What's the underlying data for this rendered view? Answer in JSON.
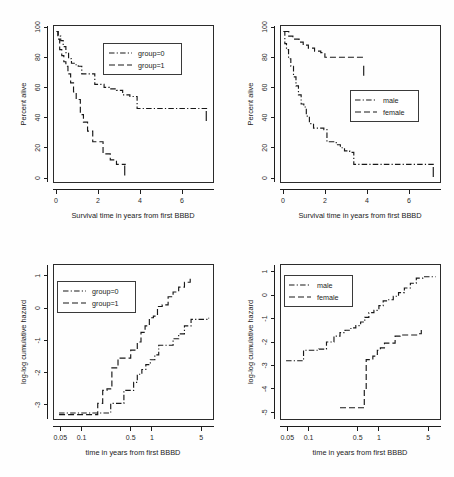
{
  "figure": {
    "background_color": "#fefefe",
    "line_color": "#181818",
    "panel_count": 4,
    "layout": "2x2 grid"
  },
  "chart_data": [
    {
      "id": "top-left",
      "type": "line",
      "title": "",
      "xlabel": "Survival time in years from first BBBD",
      "ylabel": "Percent alive",
      "xlim": [
        -0.15,
        7.6
      ],
      "ylim": [
        0,
        104
      ],
      "xticks": [
        0,
        2,
        4,
        6
      ],
      "xticklabels": [
        "0",
        "2",
        "4",
        "6"
      ],
      "yticks": [
        0,
        20,
        40,
        60,
        80,
        100
      ],
      "yticklabels": [
        "0",
        "20",
        "40",
        "60",
        "80",
        "100"
      ],
      "grid": false,
      "legend_position": "top-right-inside",
      "legend": [
        "group=0",
        "group=1"
      ],
      "series": [
        {
          "name": "group=0",
          "linestyle": "dashdot",
          "x": [
            0,
            0.08,
            0.2,
            0.32,
            0.45,
            0.58,
            0.72,
            0.9,
            1.05,
            1.22,
            1.55,
            1.85,
            2.05,
            2.3,
            2.55,
            2.9,
            3.2,
            3.55,
            3.9,
            4.15,
            7.3
          ],
          "y": [
            100,
            97,
            94,
            90,
            86,
            82,
            79,
            78,
            77,
            72,
            72,
            65,
            65,
            63,
            62,
            61,
            58,
            57,
            49,
            49,
            49
          ],
          "censor_marks_x": [
            7.25
          ],
          "censor_marks_y": [
            44
          ]
        },
        {
          "name": "group=1",
          "linestyle": "dashed",
          "x": [
            0,
            0.06,
            0.15,
            0.25,
            0.35,
            0.45,
            0.55,
            0.68,
            0.82,
            0.95,
            1.05,
            1.15,
            1.3,
            1.5,
            1.75,
            2.05,
            2.25,
            2.45,
            2.6,
            2.9,
            3.35
          ],
          "y": [
            100,
            95,
            88,
            84,
            80,
            77,
            72,
            66,
            60,
            55,
            55,
            45,
            40,
            34,
            27,
            27,
            19,
            19,
            15,
            12,
            12
          ],
          "censor_marks_x": [
            3.3
          ],
          "censor_marks_y": [
            8
          ]
        }
      ]
    },
    {
      "id": "top-right",
      "type": "line",
      "title": "",
      "xlabel": "Survival time in years from first BBBD",
      "ylabel": "Percent alive",
      "xlim": [
        -0.15,
        7.6
      ],
      "ylim": [
        0,
        104
      ],
      "xticks": [
        0,
        2,
        4,
        6
      ],
      "xticklabels": [
        "0",
        "2",
        "4",
        "6"
      ],
      "yticks": [
        0,
        20,
        40,
        60,
        80,
        100
      ],
      "yticklabels": [
        "0",
        "20",
        "40",
        "60",
        "80",
        "100"
      ],
      "grid": false,
      "legend_position": "middle-right-inside",
      "legend": [
        "male",
        "female"
      ],
      "series": [
        {
          "name": "male",
          "linestyle": "dashdot",
          "x": [
            0,
            0.06,
            0.14,
            0.24,
            0.35,
            0.48,
            0.6,
            0.72,
            0.85,
            0.98,
            1.1,
            1.25,
            1.45,
            1.7,
            1.95,
            2.1,
            2.35,
            2.55,
            2.75,
            2.95,
            3.2,
            3.4,
            7.3
          ],
          "y": [
            100,
            92,
            88,
            82,
            77,
            70,
            64,
            58,
            52,
            50,
            44,
            39,
            36,
            36,
            35,
            27,
            27,
            25,
            23,
            21,
            20,
            12,
            12
          ],
          "censor_marks_x": [
            7.25
          ],
          "censor_marks_y": [
            7
          ]
        },
        {
          "name": "female",
          "linestyle": "dashed",
          "x": [
            0,
            0.1,
            0.25,
            0.45,
            0.6,
            0.75,
            0.95,
            1.2,
            1.5,
            1.8,
            2.0,
            2.3,
            2.7,
            3.2,
            3.9
          ],
          "y": [
            100,
            100,
            97,
            95,
            95,
            93,
            91,
            89,
            87,
            86,
            83,
            83,
            83,
            83,
            83
          ],
          "censor_marks_x": [
            3.88
          ],
          "censor_marks_y": [
            74
          ]
        }
      ]
    },
    {
      "id": "bottom-left",
      "type": "line",
      "title": "",
      "xlabel": "time in years from first BBBD",
      "ylabel": "log-log cumulative hazard",
      "xscale": "log",
      "xlim": [
        0.04,
        7.5
      ],
      "ylim": [
        -3.45,
        1.35
      ],
      "xticks": [
        0.05,
        0.1,
        0.5,
        1,
        5
      ],
      "xticklabels": [
        "0.05",
        "0.1",
        "0.5",
        "1",
        "5"
      ],
      "yticks": [
        -3,
        -2,
        -1,
        0,
        1
      ],
      "yticklabels": [
        "-3",
        "-2",
        "-1",
        "0",
        "1"
      ],
      "grid": false,
      "legend_position": "top-left-inside",
      "legend": [
        "group=0",
        "group=1"
      ],
      "series": [
        {
          "name": "group=0",
          "linestyle": "dashdot",
          "x": [
            0.048,
            0.09,
            0.13,
            0.16,
            0.2,
            0.26,
            0.33,
            0.4,
            0.48,
            0.55,
            0.62,
            0.72,
            0.82,
            0.95,
            1.1,
            1.25,
            1.45,
            1.7,
            2.0,
            2.4,
            2.9,
            3.6,
            4.6,
            6.4
          ],
          "y": [
            -3.25,
            -3.25,
            -3.25,
            -3.25,
            -3.25,
            -2.95,
            -2.95,
            -2.55,
            -2.55,
            -2.3,
            -2.05,
            -1.9,
            -1.75,
            -1.6,
            -1.45,
            -1.15,
            -1.15,
            -1.15,
            -0.95,
            -0.8,
            -0.55,
            -0.35,
            -0.35,
            -0.3
          ]
        },
        {
          "name": "group=1",
          "linestyle": "dashed",
          "x": [
            0.048,
            0.1,
            0.14,
            0.17,
            0.2,
            0.23,
            0.27,
            0.33,
            0.42,
            0.5,
            0.56,
            0.62,
            0.7,
            0.8,
            0.92,
            1.05,
            1.2,
            1.4,
            1.7,
            2.0,
            2.4,
            2.9,
            3.5
          ],
          "y": [
            -3.3,
            -3.3,
            -3.3,
            -2.95,
            -2.55,
            -2.5,
            -1.85,
            -1.55,
            -1.55,
            -1.3,
            -1.3,
            -1.05,
            -0.75,
            -0.55,
            -0.3,
            -0.25,
            0.05,
            0.1,
            0.35,
            0.5,
            0.65,
            0.8,
            1.0
          ]
        }
      ]
    },
    {
      "id": "bottom-right",
      "type": "line",
      "title": "",
      "xlabel": "time in years from first BBBD",
      "ylabel": "log-log cumulative hazard",
      "xscale": "log",
      "xlim": [
        0.04,
        7.5
      ],
      "ylim": [
        -5.3,
        1.3
      ],
      "xticks": [
        0.05,
        0.1,
        0.5,
        1,
        5
      ],
      "xticklabels": [
        "0.05",
        "0.1",
        "0.5",
        "1",
        "5"
      ],
      "yticks": [
        -5,
        -4,
        -3,
        -2,
        -1,
        0,
        1
      ],
      "yticklabels": [
        "-5",
        "-4",
        "-3",
        "-2",
        "-1",
        "0",
        "1"
      ],
      "grid": false,
      "legend_position": "top-left-inside",
      "legend": [
        "male",
        "female"
      ],
      "series": [
        {
          "name": "male",
          "linestyle": "dashdot",
          "x": [
            0.048,
            0.065,
            0.085,
            0.11,
            0.14,
            0.18,
            0.23,
            0.28,
            0.33,
            0.4,
            0.47,
            0.55,
            0.63,
            0.72,
            0.85,
            1.0,
            1.15,
            1.35,
            1.6,
            1.9,
            2.3,
            2.8,
            3.4,
            4.2,
            6.4
          ],
          "y": [
            -2.8,
            -2.8,
            -2.35,
            -2.35,
            -2.3,
            -2.0,
            -1.75,
            -1.6,
            -1.5,
            -1.4,
            -1.3,
            -1.15,
            -0.95,
            -0.75,
            -0.65,
            -0.45,
            -0.25,
            -0.2,
            -0.05,
            0.1,
            0.3,
            0.5,
            0.72,
            0.78,
            0.78
          ]
        },
        {
          "name": "female",
          "linestyle": "dashed",
          "x": [
            0.28,
            0.36,
            0.45,
            0.55,
            0.62,
            0.66,
            0.72,
            0.82,
            0.95,
            1.05,
            1.2,
            1.4,
            1.7,
            2.0,
            2.4,
            2.9,
            3.5,
            4.0
          ],
          "y": [
            -4.8,
            -4.8,
            -4.8,
            -4.8,
            -4.0,
            -2.75,
            -2.75,
            -2.6,
            -2.35,
            -2.25,
            -2.05,
            -2.05,
            -1.75,
            -1.7,
            -1.7,
            -1.7,
            -1.65,
            -1.4
          ]
        }
      ]
    }
  ]
}
